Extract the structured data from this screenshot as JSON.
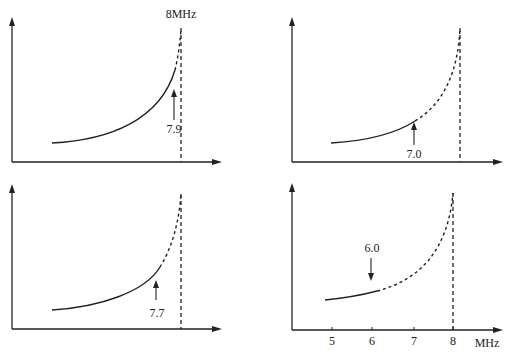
{
  "figure": {
    "asymptote_label": "8MHz",
    "x_unit_label": "MHz",
    "x_ticks": [
      "5",
      "6",
      "7",
      "8"
    ],
    "panels": [
      {
        "id": "top-left",
        "marker_value": "7.9",
        "marker_direction": "up",
        "solid_until_mhz": 7.9,
        "asymptote_mhz": 8,
        "show_asymptote_label": true,
        "show_x_ticks": false
      },
      {
        "id": "top-right",
        "marker_value": "7.0",
        "marker_direction": "up",
        "solid_until_mhz": 7.0,
        "asymptote_mhz": 8,
        "show_asymptote_label": false,
        "show_x_ticks": false
      },
      {
        "id": "bottom-left",
        "marker_value": "7.7",
        "marker_direction": "up",
        "solid_until_mhz": 7.7,
        "asymptote_mhz": 8,
        "show_asymptote_label": false,
        "show_x_ticks": false
      },
      {
        "id": "bottom-right",
        "marker_value": "6.0",
        "marker_direction": "down",
        "solid_until_mhz": 6.0,
        "asymptote_mhz": 8,
        "show_asymptote_label": false,
        "show_x_ticks": true
      }
    ]
  }
}
